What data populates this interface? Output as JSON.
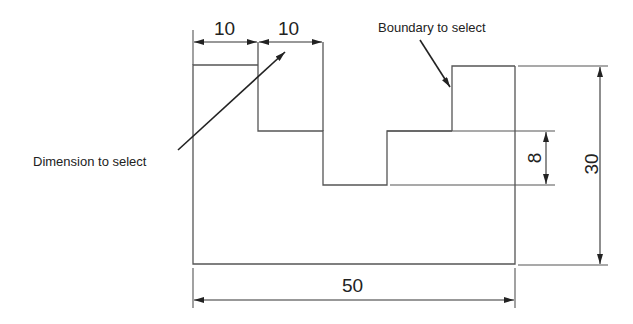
{
  "diagram": {
    "type": "technical-drawing",
    "callouts": {
      "dimension": "Dimension to select",
      "boundary": "Boundary to select"
    },
    "dimensions": {
      "top_left": "10",
      "top_right": "10",
      "bottom": "50",
      "right_overall": "30",
      "right_small": "8"
    },
    "colors": {
      "line": "#555555",
      "text": "#222222",
      "background": "#ffffff"
    }
  }
}
